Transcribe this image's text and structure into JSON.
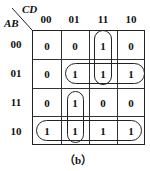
{
  "kmap": {
    "row_var": "AB",
    "col_var": "CD",
    "col_labels": [
      "00",
      "01",
      "11",
      "10"
    ],
    "row_labels": [
      "00",
      "01",
      "11",
      "10"
    ],
    "cells": [
      [
        "0",
        "0",
        "1",
        "0"
      ],
      [
        "0",
        "1",
        "1",
        "1"
      ],
      [
        "0",
        "1",
        "0",
        "0"
      ],
      [
        "1",
        "1",
        "1",
        "1"
      ]
    ],
    "groups": [
      {
        "name": "col-11-rows-00-01",
        "cells": [
          [
            0,
            2
          ],
          [
            1,
            2
          ]
        ]
      },
      {
        "name": "row-01-cols-01-11-10",
        "cells": [
          [
            1,
            1
          ],
          [
            1,
            2
          ],
          [
            1,
            3
          ]
        ]
      },
      {
        "name": "col-01-rows-11-10",
        "cells": [
          [
            2,
            1
          ],
          [
            3,
            1
          ]
        ]
      },
      {
        "name": "row-10-all",
        "cells": [
          [
            3,
            0
          ],
          [
            3,
            1
          ],
          [
            3,
            2
          ],
          [
            3,
            3
          ]
        ]
      }
    ]
  },
  "caption": "（b）"
}
